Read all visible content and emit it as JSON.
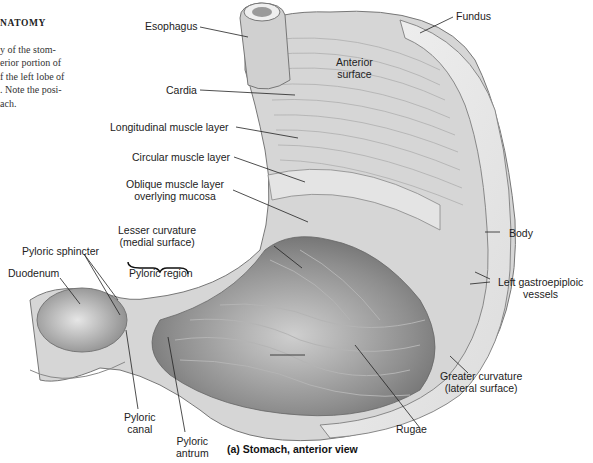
{
  "sidebar": {
    "heading": "NATOMY",
    "text_lines": [
      "y of the stom-",
      "erior portion of",
      "f the left lobe of",
      ". Note the posi-",
      "ach."
    ]
  },
  "figure": {
    "caption": "(a) Stomach, anterior view",
    "labels": {
      "esophagus": "Esophagus",
      "fundus": "Fundus",
      "anterior_surface_1": "Anterior",
      "anterior_surface_2": "surface",
      "cardia": "Cardia",
      "longitudinal": "Longitudinal muscle layer",
      "circular": "Circular muscle layer",
      "oblique_1": "Oblique muscle layer",
      "oblique_2": "overlying mucosa",
      "lesser_1": "Lesser curvature",
      "lesser_2": "(medial surface)",
      "body": "Body",
      "pyloric_sphincter": "Pyloric sphincter",
      "duodenum": "Duodenum",
      "pyloric_region": "Pyloric region",
      "gastroepiploic_1": "Left gastroepiploic",
      "gastroepiploic_2": "vessels",
      "greater_1": "Greater curvature",
      "greater_2": "(lateral surface)",
      "pyloric_canal_1": "Pyloric",
      "pyloric_canal_2": "canal",
      "pyloric_antrum_1": "Pyloric",
      "pyloric_antrum_2": "antrum",
      "rugae": "Rugae"
    }
  }
}
